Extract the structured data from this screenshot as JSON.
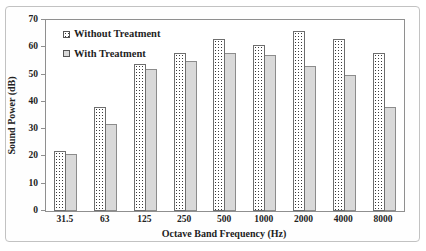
{
  "figure": {
    "background": "#ffffff",
    "frame_border_color": "#c2c2c2"
  },
  "chart_data": {
    "type": "bar",
    "title": "",
    "categories": [
      "31.5",
      "63",
      "125",
      "250",
      "500",
      "1000",
      "2000",
      "4000",
      "8000"
    ],
    "series": [
      {
        "name": "Without Treatment",
        "values": [
          22,
          38,
          54,
          58,
          63,
          61,
          66,
          63,
          58
        ],
        "fill_style": "dotted-pattern",
        "fill_color": "#ffffff",
        "pattern_dot_color": "#3a3a3a",
        "border_color": "#6e6e6e"
      },
      {
        "name": "With Treatment",
        "values": [
          21,
          32,
          52,
          55,
          58,
          57,
          53,
          50,
          38
        ],
        "fill_style": "solid",
        "fill_color": "#d9d9d9",
        "border_color": "#8c8c8c"
      }
    ],
    "xlabel": "Octave Band Frequency (Hz)",
    "ylabel": "Sound Power (dB)",
    "ylim": [
      0,
      70
    ],
    "yticks": [
      0,
      10,
      20,
      30,
      40,
      50,
      60,
      70
    ],
    "grid": false,
    "legend_position": "top-left-inside",
    "axis_color": "#8f8f8f",
    "text_color": "#222222"
  }
}
